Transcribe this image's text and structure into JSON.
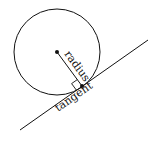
{
  "diagram": {
    "labels": {
      "radius": "radius",
      "tangent": "tangent"
    },
    "circle": {
      "cx": 57,
      "cy": 52,
      "r": 43
    },
    "center_point": {
      "x": 57,
      "y": 52
    },
    "tangent_point": {
      "x": 82,
      "y": 86
    },
    "tangent_line": {
      "x1": 20,
      "y1": 130,
      "x2": 148,
      "y2": 40
    },
    "stroke_color": "#111111"
  }
}
